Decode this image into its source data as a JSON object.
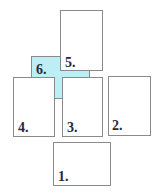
{
  "diagram": {
    "cards": [
      {
        "id": 1,
        "label": "1.",
        "fill": "#ffffff"
      },
      {
        "id": 2,
        "label": "2.",
        "fill": "#ffffff"
      },
      {
        "id": 3,
        "label": "3.",
        "fill": "#ffffff"
      },
      {
        "id": 4,
        "label": "4.",
        "fill": "#ffffff"
      },
      {
        "id": 5,
        "label": "5.",
        "fill": "#ffffff"
      },
      {
        "id": 6,
        "label": "6.",
        "fill": "#bdeef6"
      }
    ]
  }
}
